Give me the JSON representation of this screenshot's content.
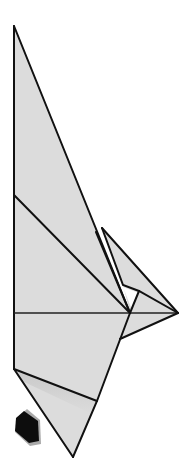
{
  "diagram": {
    "colors": {
      "paper": "#dcdcdc",
      "line": "#111111",
      "arrow": "#0d0d0d",
      "background": "#ffffff"
    },
    "icons": {
      "push_arrow": "push-arrow-icon"
    }
  }
}
